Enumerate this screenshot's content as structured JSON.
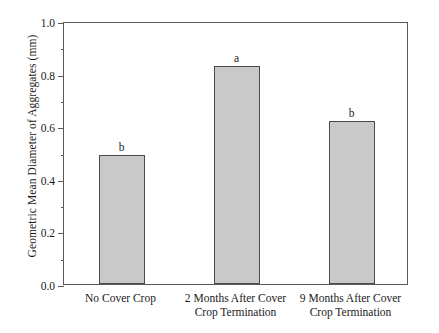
{
  "chart_data": {
    "type": "bar",
    "title": "",
    "xlabel": "",
    "ylabel": "Geometric Mean Diameter of Aggregates (mm)",
    "categories": [
      "No Cover Crop",
      "2 Months After Cover Crop Termination",
      "9 Months After Cover Crop Termination"
    ],
    "category_lines": [
      [
        "No Cover Crop"
      ],
      [
        "2 Months After Cover",
        "Crop Termination"
      ],
      [
        "9 Months After Cover",
        "Crop Termination"
      ]
    ],
    "values": [
      0.49,
      0.83,
      0.62
    ],
    "annotations": [
      "b",
      "a",
      "b"
    ],
    "ylim": [
      0.0,
      1.0
    ],
    "ytick_labels": [
      "0.0",
      "0.2",
      "0.4",
      "0.6",
      "0.8",
      "1.0"
    ],
    "ytick_values": [
      0.0,
      0.2,
      0.4,
      0.6,
      0.8,
      1.0
    ],
    "yminor_tick_values": [
      0.1,
      0.3,
      0.5,
      0.7,
      0.9
    ],
    "grid": false,
    "legend": "none",
    "bar_color": "#c9c9c9",
    "bar_edge_color": "#4a4a4a",
    "axis_color": "#5a5a5a"
  }
}
